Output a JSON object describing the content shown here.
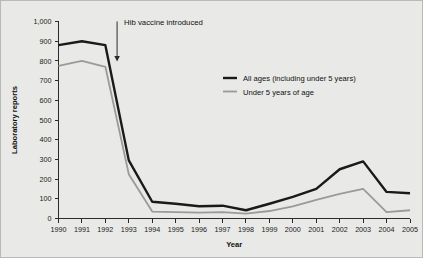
{
  "figure": {
    "background_color": "#e9e9e7",
    "border_color": "#b9b9b6"
  },
  "chart_data": {
    "type": "line",
    "title": "",
    "xlabel": "Year",
    "ylabel": "Laboratory reports",
    "categories": [
      1990,
      1991,
      1992,
      1993,
      1994,
      1995,
      1996,
      1997,
      1998,
      1999,
      2000,
      2001,
      2002,
      2003,
      2004,
      2005
    ],
    "x_tick_labels": [
      "1990",
      "1991",
      "1992",
      "1993",
      "1994",
      "1995",
      "1996",
      "1997",
      "1998",
      "1999",
      "2000",
      "2001",
      "2002",
      "2003",
      "2004",
      "2005"
    ],
    "y_tick_labels": [
      "0",
      "100",
      "200",
      "300",
      "400",
      "500",
      "600",
      "700",
      "800",
      "900",
      "1,000"
    ],
    "y_tick_values": [
      0,
      100,
      200,
      300,
      400,
      500,
      600,
      700,
      800,
      900,
      1000
    ],
    "ylim": [
      0,
      1000
    ],
    "xlim": [
      1990,
      2005
    ],
    "grid": false,
    "legend_position": "upper-right-inside",
    "series": [
      {
        "name": "Under 5 years of age",
        "color": "#9a9a9a",
        "stroke_width": 1.8,
        "values": [
          775,
          800,
          770,
          225,
          35,
          32,
          30,
          32,
          25,
          38,
          62,
          95,
          125,
          150,
          32,
          42
        ]
      },
      {
        "name": "All ages (including under 5 years)",
        "color": "#1a1a1a",
        "stroke_width": 2.4,
        "values": [
          880,
          900,
          880,
          295,
          85,
          75,
          62,
          65,
          42,
          75,
          110,
          150,
          250,
          290,
          135,
          128
        ]
      }
    ],
    "annotations": [
      {
        "text": "Hib vaccine introduced",
        "x_value": 1992.5,
        "arrow_from_y": 1000,
        "arrow_to_y": 800
      }
    ]
  }
}
